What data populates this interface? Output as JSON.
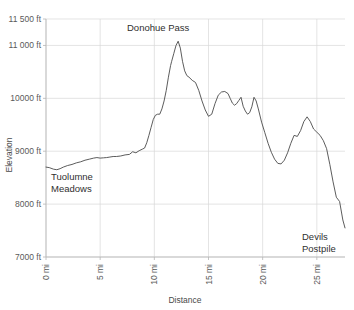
{
  "chart_data": {
    "type": "line",
    "title": "",
    "xlabel": "Distance",
    "ylabel": "Elevation",
    "xlim": [
      0,
      27.6
    ],
    "ylim": [
      7000,
      11500
    ],
    "grid": true,
    "legend": false,
    "x_tick_labels": [
      "0 mi",
      "5 mi",
      "10 mi",
      "15 mi",
      "20 mi",
      "25 mi"
    ],
    "x_tick_values": [
      0,
      5,
      10,
      15,
      20,
      25
    ],
    "y_tick_labels": [
      "11 500 ft",
      "11 000 ft",
      "10000 ft",
      "9000 ft",
      "8000 ft",
      "7000 ft"
    ],
    "y_tick_values": [
      11500,
      11000,
      10000,
      9000,
      8000,
      7000
    ],
    "series": [
      {
        "name": "Elevation profile",
        "x": [
          0.0,
          0.3,
          0.7,
          1.0,
          1.3,
          1.6,
          2.0,
          2.4,
          2.8,
          3.2,
          3.6,
          4.0,
          4.4,
          4.7,
          5.0,
          5.3,
          5.6,
          5.9,
          6.2,
          6.5,
          6.9,
          7.3,
          7.7,
          8.0,
          8.3,
          8.6,
          8.9,
          9.1,
          9.3,
          9.5,
          9.7,
          9.9,
          10.1,
          10.3,
          10.5,
          10.7,
          10.9,
          11.1,
          11.3,
          11.5,
          11.6,
          11.8,
          12.0,
          12.2,
          12.4,
          12.6,
          12.8,
          13.0,
          13.2,
          13.5,
          13.8,
          14.1,
          14.4,
          14.7,
          15.0,
          15.3,
          15.6,
          15.9,
          16.2,
          16.5,
          16.8,
          17.0,
          17.2,
          17.4,
          17.6,
          17.8,
          18.0,
          18.2,
          18.4,
          18.6,
          18.8,
          19.0,
          19.2,
          19.4,
          19.6,
          19.9,
          20.2,
          20.5,
          20.8,
          21.1,
          21.4,
          21.7,
          22.0,
          22.3,
          22.6,
          22.9,
          23.2,
          23.5,
          23.8,
          24.1,
          24.4,
          24.7,
          25.0,
          25.3,
          25.6,
          25.9,
          26.2,
          26.5,
          26.8,
          27.1,
          27.4,
          27.6
        ],
        "y": [
          8700,
          8690,
          8660,
          8650,
          8670,
          8700,
          8730,
          8750,
          8780,
          8800,
          8830,
          8850,
          8870,
          8880,
          8870,
          8875,
          8880,
          8890,
          8900,
          8900,
          8910,
          8930,
          8940,
          8990,
          8970,
          9010,
          9040,
          9060,
          9160,
          9300,
          9450,
          9600,
          9680,
          9700,
          9700,
          9800,
          9950,
          10150,
          10400,
          10620,
          10700,
          10850,
          11000,
          11080,
          10950,
          10700,
          10520,
          10430,
          10400,
          10340,
          10300,
          10150,
          9950,
          9780,
          9660,
          9700,
          9900,
          10060,
          10120,
          10130,
          10090,
          10000,
          9910,
          9870,
          9900,
          9960,
          10020,
          9850,
          9760,
          9700,
          9730,
          9840,
          10020,
          9950,
          9800,
          9550,
          9350,
          9150,
          8980,
          8850,
          8770,
          8760,
          8830,
          8970,
          9150,
          9300,
          9280,
          9390,
          9560,
          9650,
          9560,
          9420,
          9360,
          9300,
          9200,
          9050,
          8750,
          8420,
          8130,
          8050,
          7700,
          7550
        ]
      }
    ],
    "annotations": [
      {
        "name": "tuolumne-meadows-label",
        "lines": [
          "Tuolumne",
          "Meadows"
        ],
        "x_px": 51,
        "y_px": 180
      },
      {
        "name": "donohue-pass-label",
        "lines": [
          "Donohue Pass"
        ],
        "x_px": 127,
        "y_px": 31
      },
      {
        "name": "devils-postpile-label",
        "lines": [
          "Devils",
          "Postpile"
        ],
        "x_px": 302,
        "y_px": 240
      }
    ],
    "colors": {
      "line": "#4a4a4a",
      "grid": "#d9d9d9",
      "axis": "#b5b5b5",
      "text": "#5a5a5a",
      "background": "#ffffff"
    }
  }
}
